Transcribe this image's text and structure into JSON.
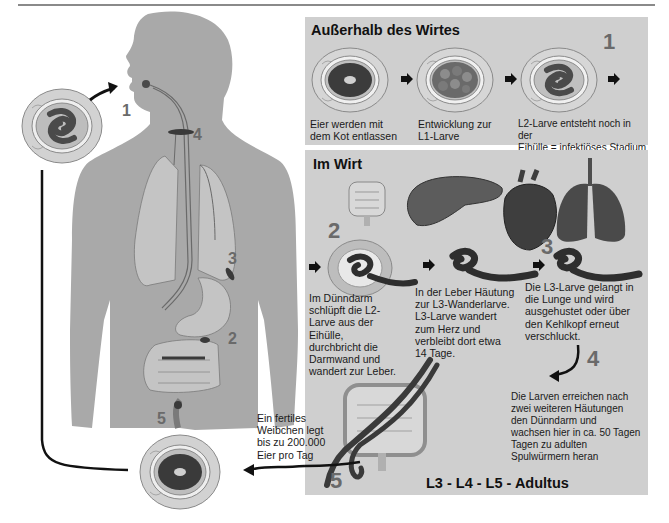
{
  "figure": {
    "title_outside": "Außerhalb des Wirtes",
    "title_inside": "Im Wirt",
    "bottom_label": "L3 - L4 - L5 - Adultus"
  },
  "outside_host": {
    "stages": [
      {
        "caption_line1": "Eier werden mit",
        "caption_line2": "dem Kot entlassen",
        "icon": "unembryonated-egg"
      },
      {
        "caption_line1": "Entwicklung zur",
        "caption_line2": "L1-Larve",
        "icon": "dividing-egg"
      },
      {
        "caption_line1": "L2-Larve entsteht noch in der",
        "caption_line2": "Eihülle = infektiöses Stadium",
        "icon": "larvated-egg",
        "number": "1"
      }
    ]
  },
  "inside_host": {
    "organs": [
      "intestine-icon",
      "liver-icon",
      "heart-icon",
      "lungs-icon"
    ],
    "steps": [
      {
        "number": "2",
        "lines": [
          "Im Dünndarm",
          "schlüpft die L2-",
          "Larve aus der",
          "Eihülle,",
          "durchbricht die",
          "Darmwand und",
          "wandert zur Leber."
        ]
      },
      {
        "number": "",
        "lines": [
          "In der Leber Häutung",
          "zur L3-Wanderlarve.",
          "L3-Larve wandert",
          "zum Herz und",
          "verbleibt dort etwa",
          "14 Tage."
        ]
      },
      {
        "number": "3",
        "lines": [
          "Die L3-Larve gelangt in",
          "die Lunge und wird",
          "ausgehustet oder über",
          "den Kehlkopf erneut",
          "verschluckt."
        ]
      },
      {
        "number": "4",
        "lines": [
          "Die Larven erreichen nach",
          "zwei weiteren Häutungen",
          "den Dünndarm und",
          "wachsen hier in ca. 50 Tagen",
          "Tagen zu adulten",
          "Spulwürmern heran"
        ]
      },
      {
        "number": "5",
        "lines": [
          "Ein fertiles",
          "Weibchen legt",
          "bis zu 200.000",
          "Eier pro Tag"
        ]
      }
    ]
  },
  "body_labels": {
    "n1": "1",
    "n2": "2",
    "n3": "3",
    "n4": "4",
    "n5": "5"
  },
  "colors": {
    "panel_bg": "#cfcfcf",
    "body_fill": "#a9a9a9",
    "organ_fill": "#c4c4c4",
    "worm": "#3a3a3a",
    "number_gray": "#6a6a6a"
  }
}
